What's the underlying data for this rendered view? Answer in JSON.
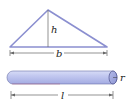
{
  "triangle": {
    "height_label": "h",
    "base_label": "b",
    "stroke_color": "#8b8fd0"
  },
  "cylinder": {
    "radius_label": "r",
    "length_label": "l",
    "fill_color": "#bcc3ee",
    "stroke_color": "#4a4f8a"
  }
}
